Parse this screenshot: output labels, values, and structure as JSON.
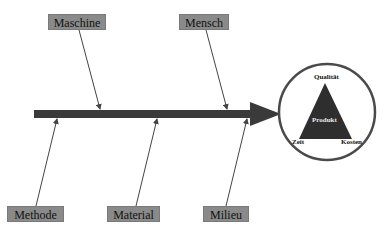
{
  "diagram": {
    "type": "fishbone",
    "colors": {
      "spine": "#3a3a3a",
      "bone": "#444444",
      "label_bg": "#8a8a8a",
      "circle_stroke": "#4a4a4a",
      "triangle": "#2e2e2e"
    },
    "causes": {
      "top": [
        {
          "label": "Maschine"
        },
        {
          "label": "Mensch"
        }
      ],
      "bottom": [
        {
          "label": "Methode"
        },
        {
          "label": "Material"
        },
        {
          "label": "Milieu"
        }
      ]
    },
    "effect": {
      "center": "Produkt",
      "vertices": {
        "top": "Qualität",
        "left": "Zeit",
        "right": "Kosten"
      }
    }
  }
}
